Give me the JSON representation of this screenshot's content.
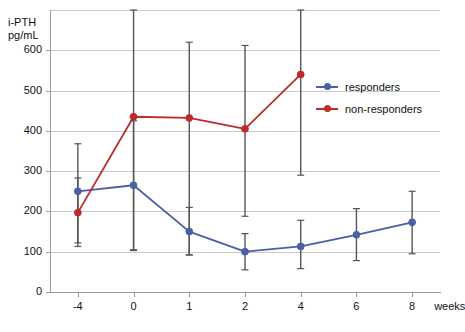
{
  "chart_data": {
    "type": "line",
    "title": "",
    "xlabel": "weeks",
    "ylabel": "i-PTH pg/mL",
    "ylabel_lines": [
      "i-PTH",
      "pg/mL"
    ],
    "x": [
      -4,
      0,
      1,
      2,
      4,
      6,
      8
    ],
    "xtick_labels": [
      "-4",
      "0",
      "1",
      "2",
      "4",
      "6",
      "8"
    ],
    "xaxis_unit_label": "weeks",
    "ytick_labels": [
      "0",
      "100",
      "200",
      "300",
      "400",
      "500",
      "600"
    ],
    "ytick_values": [
      0,
      100,
      200,
      300,
      400,
      500,
      600
    ],
    "ylim": [
      0,
      700
    ],
    "grid": true,
    "legend_position": "right-upper",
    "series": [
      {
        "name": "responders",
        "color": "#4a5fa5",
        "marker": "circle",
        "x": [
          -4,
          0,
          1,
          2,
          4,
          6,
          8
        ],
        "values": [
          250,
          265,
          150,
          100,
          113,
          142,
          173
        ],
        "err_low": [
          113,
          105,
          92,
          55,
          58,
          78,
          95
        ],
        "err_high": [
          368,
          425,
          210,
          145,
          178,
          207,
          250
        ]
      },
      {
        "name": "non-responders",
        "color": "#bb2d2d",
        "marker": "circle",
        "x": [
          -4,
          0,
          1,
          2,
          4
        ],
        "values": [
          197,
          435,
          432,
          405,
          540
        ],
        "err_low": [
          122,
          103,
          92,
          188,
          290
        ],
        "err_high": [
          283,
          700,
          620,
          612,
          700
        ]
      }
    ],
    "legend": [
      {
        "label": "responders",
        "color": "#4a5fa5"
      },
      {
        "label": "non-responders",
        "color": "#bb2d2d"
      }
    ]
  }
}
